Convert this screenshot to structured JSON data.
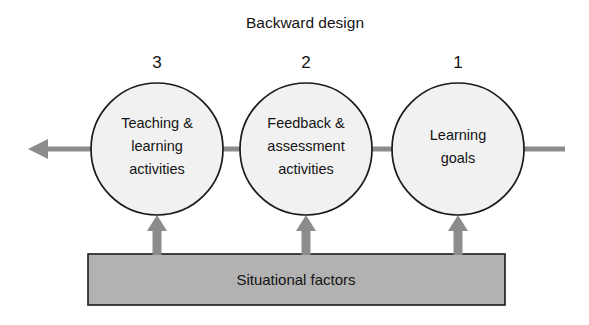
{
  "diagram": {
    "title": "Backward design",
    "type": "flow-diagram",
    "colors": {
      "circle_fill": "#f1f1f1",
      "circle_stroke": "#1a1a1a",
      "bar_fill": "#b2b2b2",
      "bar_stroke": "#1a1a1a",
      "connector": "#8c8c8c",
      "text": "#141414",
      "background": "#ffffff"
    },
    "nodes": [
      {
        "id": "teaching-learning-activities",
        "number": "3",
        "lines": [
          "Teaching &",
          "learning",
          "activities"
        ],
        "cx": 157,
        "cy": 149,
        "r": 66
      },
      {
        "id": "feedback-assessment-activities",
        "number": "2",
        "lines": [
          "Feedback &",
          "assessment",
          "activities"
        ],
        "cx": 306,
        "cy": 149,
        "r": 66
      },
      {
        "id": "learning-goals",
        "number": "1",
        "lines": [
          "Learning",
          "goals"
        ],
        "cx": 458,
        "cy": 149,
        "r": 66
      }
    ],
    "foundation_bar": {
      "label": "Situational factors",
      "x": 88,
      "y": 254,
      "width": 417,
      "height": 51
    },
    "flow_arrow": {
      "direction": "left",
      "tip_x": 28,
      "tail_x": 565,
      "y": 149,
      "label": "backward-design-flow"
    },
    "support_arrows": [
      {
        "x": 157,
        "label": "support-arrow-teaching"
      },
      {
        "x": 306,
        "label": "support-arrow-feedback"
      },
      {
        "x": 458,
        "label": "support-arrow-goals"
      }
    ]
  }
}
